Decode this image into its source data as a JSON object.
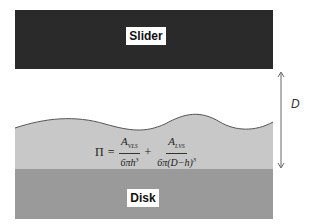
{
  "diagram": {
    "slider": {
      "label": "Slider",
      "color": "#2a2a2a"
    },
    "lubricant": {
      "color": "#c8c8c8"
    },
    "disk": {
      "label": "Disk",
      "color": "#9a9a9a"
    },
    "dimension": {
      "label": "D"
    },
    "formula": {
      "lhs": "Π",
      "equals": "=",
      "term1_num": "A",
      "term1_num_sub": "VLS",
      "term1_den": "6πh",
      "term1_den_sup": "3",
      "plus": "+",
      "term2_num": "A",
      "term2_num_sub": "LVS",
      "term2_den": "6π(D−h)",
      "term2_den_sup": "3"
    }
  }
}
